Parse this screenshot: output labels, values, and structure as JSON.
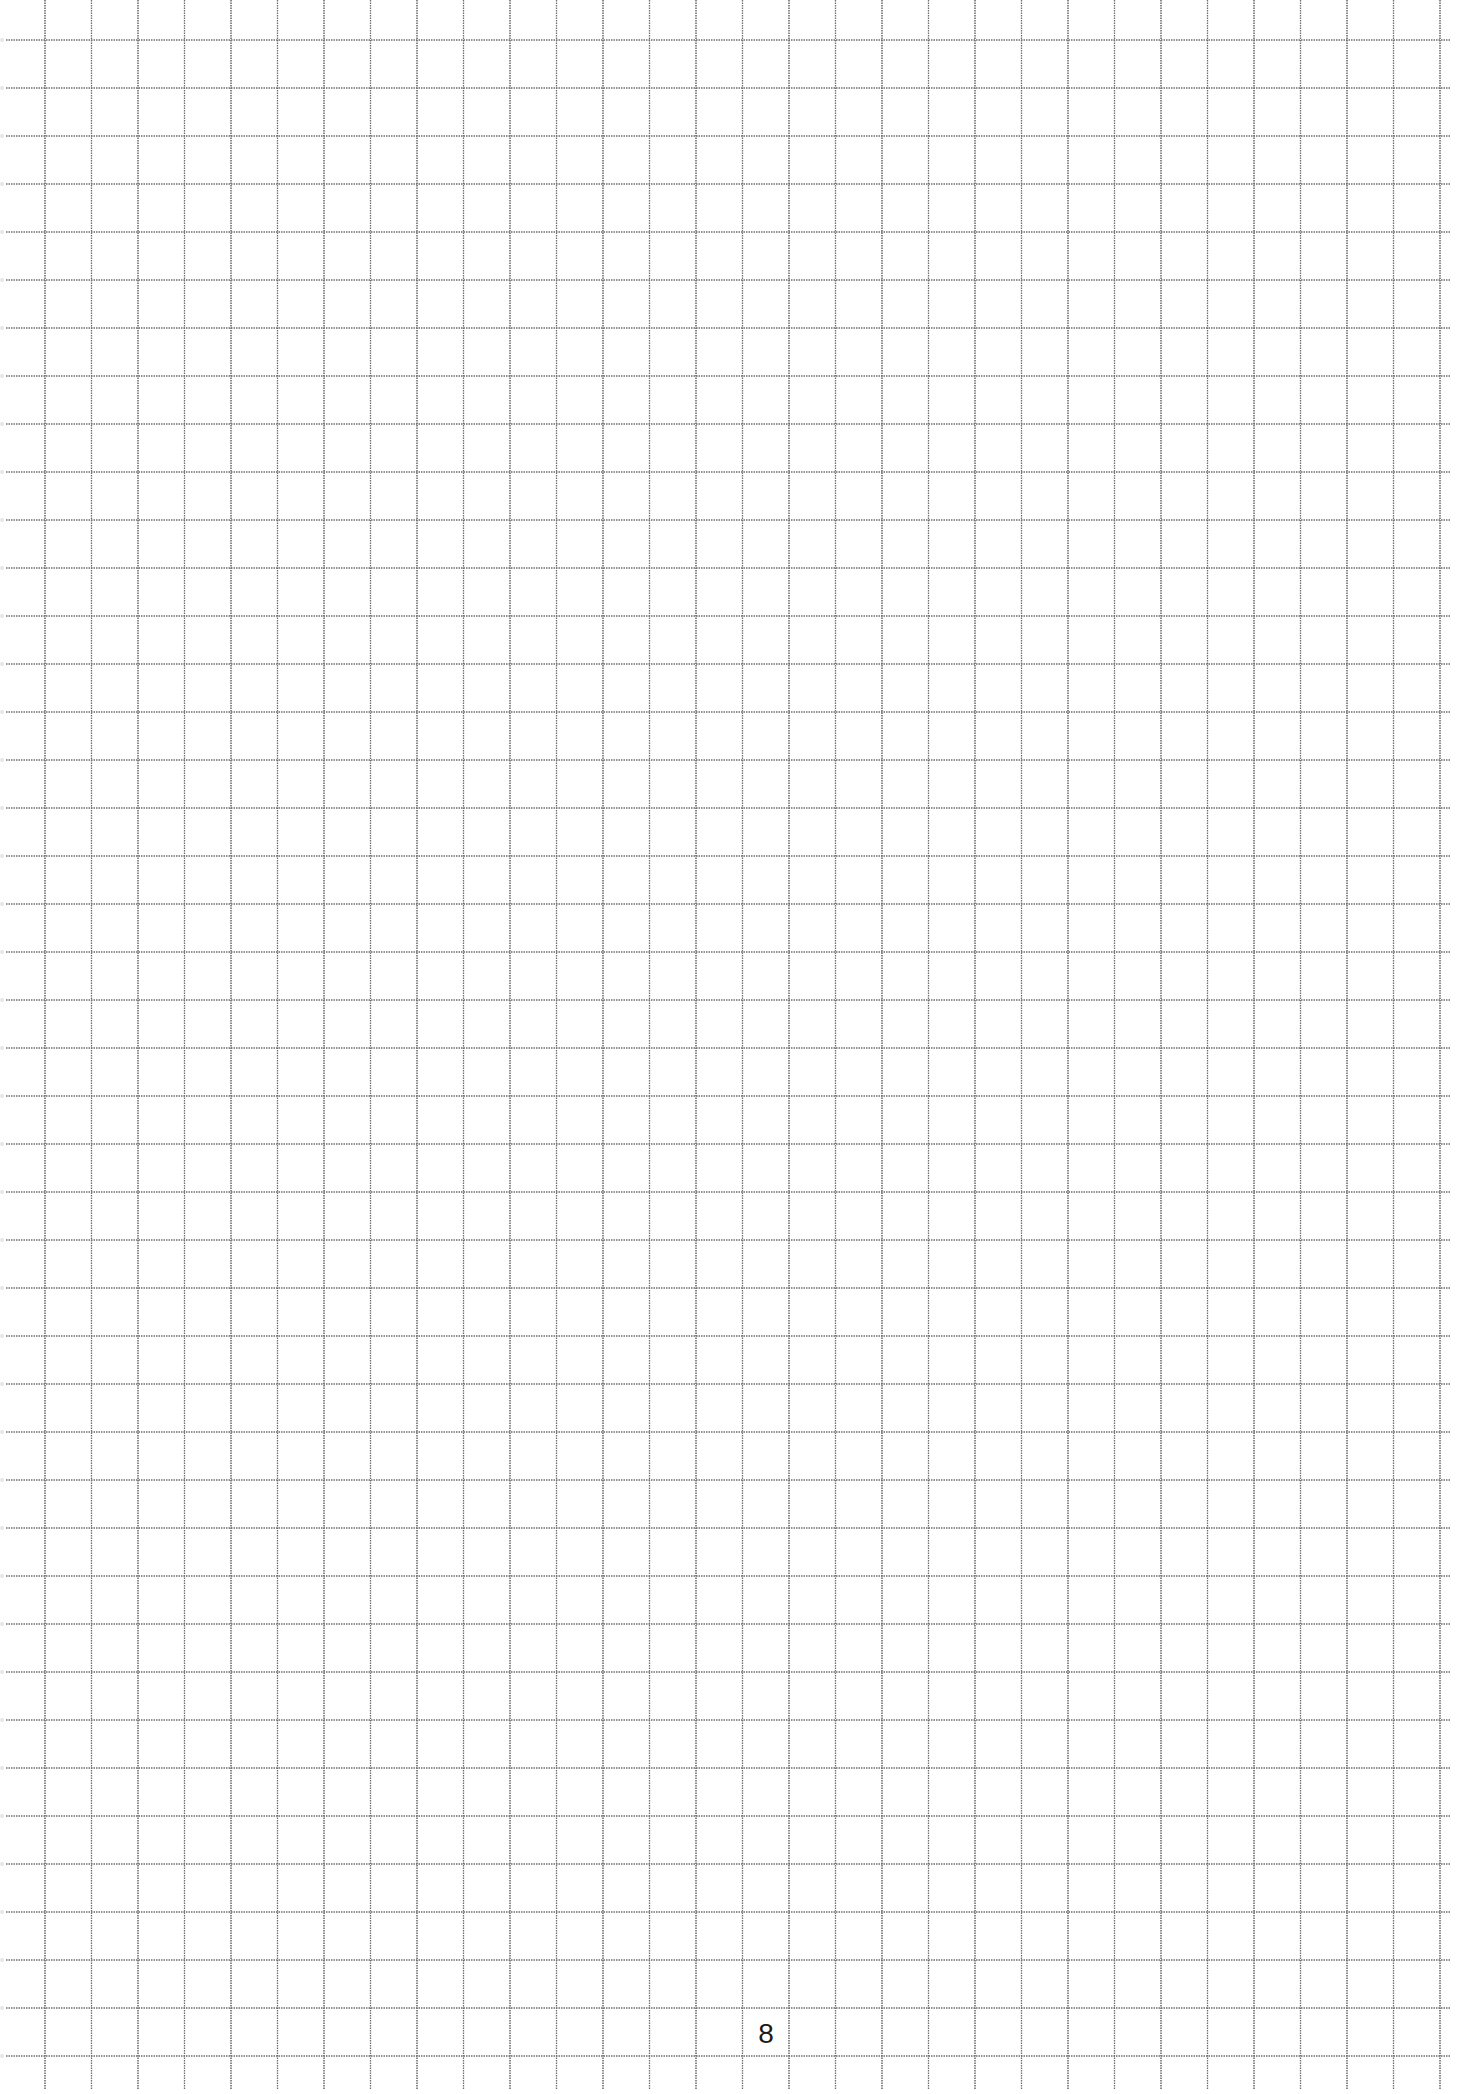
{
  "page": {
    "type": "grid-paper",
    "page_number": "8",
    "background_color": "#ffffff",
    "line_color": "#6e6e6e"
  },
  "grid": {
    "vertical_lines": {
      "count": 31,
      "first_x": 45,
      "spacing": 46.5,
      "top_y": 0,
      "bottom_y": 2090
    },
    "horizontal_lines": {
      "count": 43,
      "first_y": 40,
      "spacing": 48,
      "left_x": 6,
      "right_x": 1450
    }
  }
}
